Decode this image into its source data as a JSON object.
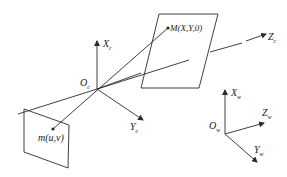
{
  "diagram": {
    "colors": {
      "line": "#2a2a2a",
      "text": "#222222",
      "background": "#ffffff"
    },
    "camera_frame": {
      "origin": {
        "label": "O",
        "sub": "c"
      },
      "x_axis": {
        "label": "X",
        "sub": "c"
      },
      "y_axis": {
        "label": "Y",
        "sub": "c"
      },
      "z_axis": {
        "label": "Z",
        "sub": "c"
      }
    },
    "world_frame": {
      "origin": {
        "label": "O",
        "sub": "w"
      },
      "x_axis": {
        "label": "X",
        "sub": "w"
      },
      "y_axis": {
        "label": "Y",
        "sub": "w"
      },
      "z_axis": {
        "label": "Z",
        "sub": "w"
      }
    },
    "world_point": {
      "label": "M(X,Y,0)"
    },
    "image_point": {
      "label": "m(u,v)"
    }
  }
}
